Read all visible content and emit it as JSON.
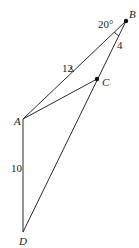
{
  "diagram": {
    "type": "geometry-figure",
    "points": {
      "A": {
        "label": "A",
        "x": 23,
        "y": 119
      },
      "B": {
        "label": "B",
        "x": 126,
        "y": 21
      },
      "C": {
        "label": "C",
        "x": 97,
        "y": 79
      },
      "D": {
        "label": "D",
        "x": 23,
        "y": 232
      }
    },
    "segments": [
      {
        "from": "A",
        "to": "B",
        "length_label": "12"
      },
      {
        "from": "B",
        "to": "C",
        "length_label": "4"
      },
      {
        "from": "C",
        "to": "D",
        "length_label": ""
      },
      {
        "from": "A",
        "to": "C",
        "length_label": ""
      },
      {
        "from": "A",
        "to": "D",
        "length_label": "10"
      }
    ],
    "angle": {
      "vertex": "B",
      "label": "20°"
    },
    "labels": {
      "A": "A",
      "B": "B",
      "C": "C",
      "D": "D",
      "AB": "12",
      "BC": "4",
      "AD": "10",
      "angle_B": "20°"
    }
  }
}
